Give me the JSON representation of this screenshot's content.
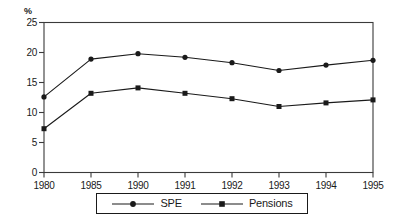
{
  "chart_data": {
    "type": "line",
    "title": "",
    "xlabel": "",
    "ylabel": "%",
    "categories": [
      "1980",
      "1985",
      "1990",
      "1991",
      "1992",
      "1993",
      "1994",
      "1995"
    ],
    "x": [
      1980,
      1985,
      1990,
      1991,
      1992,
      1993,
      1994,
      1995
    ],
    "ylim": [
      0,
      25
    ],
    "yticks": [
      0,
      5,
      10,
      15,
      20,
      25
    ],
    "ytick_labels": [
      "0",
      "5",
      "10",
      "15",
      "20",
      "25"
    ],
    "grid": false,
    "legend_position": "bottom",
    "series": [
      {
        "name": "SPE",
        "marker": "circle",
        "color": "#1a1a1a",
        "values": [
          12.6,
          18.9,
          19.8,
          19.2,
          18.3,
          17.0,
          17.9,
          18.7
        ]
      },
      {
        "name": "Pensions",
        "marker": "square",
        "color": "#1a1a1a",
        "values": [
          7.3,
          13.2,
          14.1,
          13.2,
          12.3,
          11.0,
          11.6,
          12.1
        ]
      }
    ]
  },
  "axis": {
    "unit_label": "%"
  },
  "legend": {
    "items": [
      {
        "label": "SPE",
        "marker": "circle-marker"
      },
      {
        "label": "Pensions",
        "marker": "square-marker"
      }
    ]
  },
  "colors": {
    "line": "#1a1a1a",
    "frame": "#3a3a3a",
    "background": "#ffffff"
  }
}
